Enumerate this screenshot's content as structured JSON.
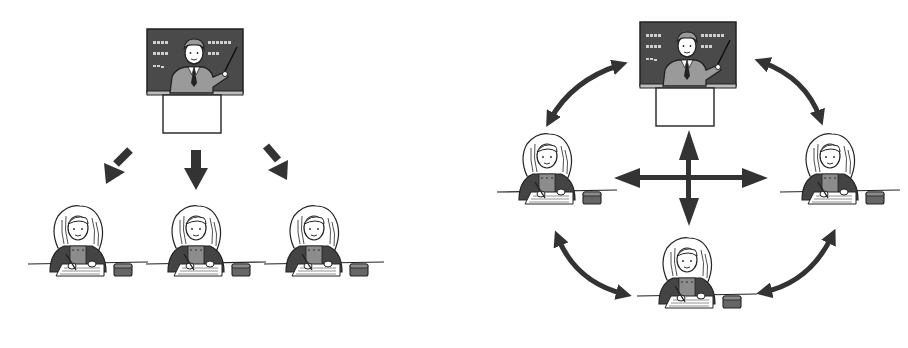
{
  "illustration": {
    "description": "Comparison of one-way lecture vs. interactive classroom communication",
    "colors": {
      "ink": "#222222",
      "arrow": "#333333",
      "board": "#4a4a4a",
      "board_text": "#cfcfcf",
      "suit": "#9a9a9a",
      "jacket": "#444444",
      "shirt": "#8c8c8c",
      "paper": "#ffffff",
      "eraser": "#666666",
      "background": "#ffffff"
    },
    "left_panel": {
      "label": "one-way-instruction",
      "teacher": {
        "role": "teacher",
        "x": 145,
        "y": 27
      },
      "arrows": [
        {
          "direction": "down-left",
          "type": "single"
        },
        {
          "direction": "down",
          "type": "single"
        },
        {
          "direction": "down-right",
          "type": "single"
        }
      ],
      "students": [
        {
          "role": "student",
          "x": 28,
          "y": 200
        },
        {
          "role": "student",
          "x": 148,
          "y": 200
        },
        {
          "role": "student",
          "x": 266,
          "y": 200
        }
      ]
    },
    "right_panel": {
      "label": "interactive-instruction",
      "teacher": {
        "role": "teacher",
        "x": 640,
        "y": 20
      },
      "center_arrow": {
        "type": "four-way"
      },
      "curved_arrows": [
        {
          "position": "top-left",
          "type": "double"
        },
        {
          "position": "top-right",
          "type": "double"
        },
        {
          "position": "bottom-left",
          "type": "double"
        },
        {
          "position": "bottom-right",
          "type": "double"
        }
      ],
      "students": [
        {
          "role": "student",
          "position": "left",
          "x": 497,
          "y": 128
        },
        {
          "role": "student",
          "position": "right",
          "x": 780,
          "y": 128
        },
        {
          "role": "student",
          "position": "bottom",
          "x": 637,
          "y": 232
        }
      ]
    }
  }
}
